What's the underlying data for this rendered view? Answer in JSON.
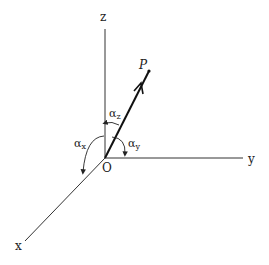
{
  "diagram": {
    "axes": {
      "z": {
        "label": "z"
      },
      "y": {
        "label": "y"
      },
      "x": {
        "label": "x"
      }
    },
    "origin": {
      "label": "O"
    },
    "point": {
      "label": "P"
    },
    "angles": [
      {
        "id": "alpha_x",
        "symbol": "α",
        "subscript": "x"
      },
      {
        "id": "alpha_y",
        "symbol": "α",
        "subscript": "y"
      },
      {
        "id": "alpha_z",
        "symbol": "α",
        "subscript": "z"
      }
    ],
    "colors": {
      "ink": "#222222",
      "background": "#ffffff"
    }
  }
}
